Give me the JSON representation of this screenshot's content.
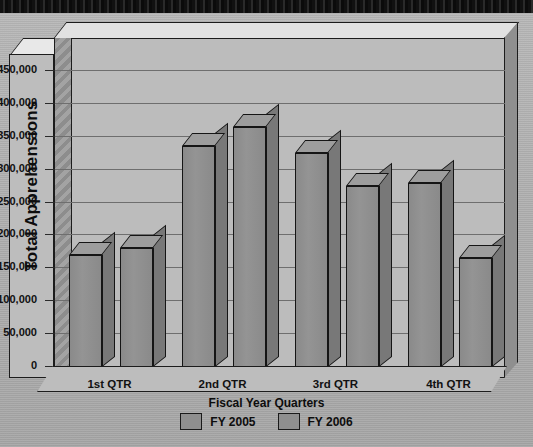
{
  "chart_data": {
    "type": "bar",
    "title": "",
    "xlabel": "Fiscal Year Quarters",
    "ylabel": "Total Apprehensions",
    "categories": [
      "1st QTR",
      "2nd QTR",
      "3rd QTR",
      "4th QTR"
    ],
    "series": [
      {
        "name": "FY 2005",
        "values": [
          190000,
          355000,
          345000,
          300000
        ]
      },
      {
        "name": "FY 2006",
        "values": [
          200000,
          385000,
          295000,
          185000
        ]
      }
    ],
    "ylim": [
      0,
      450000
    ],
    "ytick_labels": [
      "0",
      "50,000",
      "100,000",
      "150,000",
      "200,000",
      "250,000",
      "300,000",
      "350,000",
      "400,000",
      "450,000"
    ],
    "ytick_values": [
      0,
      50000,
      100000,
      150000,
      200000,
      250000,
      300000,
      350000,
      400000,
      450000
    ],
    "grid": true,
    "legend_position": "bottom",
    "legend_title": "Fiscal Year Quarters",
    "series_colors": [
      "#8f8f8f",
      "#8f8f8f"
    ]
  },
  "legend": {
    "title": "Fiscal Year Quarters",
    "items": [
      {
        "label": "FY 2005"
      },
      {
        "label": "FY 2006"
      }
    ]
  },
  "axis": {
    "y_title": "Total Apprehensions"
  }
}
